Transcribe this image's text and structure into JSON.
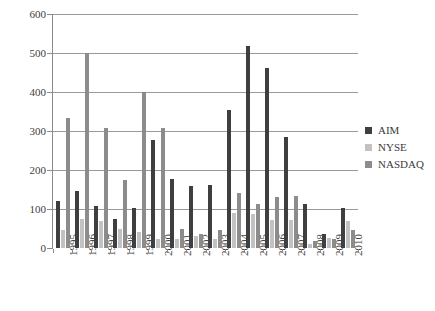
{
  "chart_data": {
    "type": "bar",
    "title": "",
    "xlabel": "",
    "ylabel": "",
    "ylim": [
      0,
      600
    ],
    "yticks": [
      0,
      100,
      200,
      300,
      400,
      500,
      600
    ],
    "grid": true,
    "legend_position": "right",
    "categories": [
      "1995",
      "1996",
      "1997",
      "1998",
      "1999",
      "2000",
      "2001",
      "2002",
      "2003",
      "2004",
      "2005",
      "2006",
      "2007",
      "2008",
      "2009",
      "2010"
    ],
    "series": [
      {
        "name": "AIM",
        "color": "#3f3f3f",
        "values": [
          121,
          145,
          107,
          75,
          102,
          277,
          177,
          160,
          162,
          355,
          519,
          462,
          284,
          114,
          36,
          102
        ]
      },
      {
        "name": "NYSE",
        "color": "#c2c2c2",
        "values": [
          46,
          74,
          69,
          49,
          40,
          22,
          23,
          32,
          23,
          89,
          88,
          73,
          72,
          10,
          26,
          69
        ]
      },
      {
        "name": "NASDAQ",
        "color": "#8c8c8c",
        "values": [
          333,
          499,
          307,
          174,
          400,
          307,
          48,
          37,
          45,
          140,
          113,
          132,
          134,
          19,
          22,
          47
        ]
      }
    ]
  },
  "legend": {
    "items": [
      {
        "label": "AIM"
      },
      {
        "label": "NYSE"
      },
      {
        "label": "NASDAQ"
      }
    ]
  }
}
